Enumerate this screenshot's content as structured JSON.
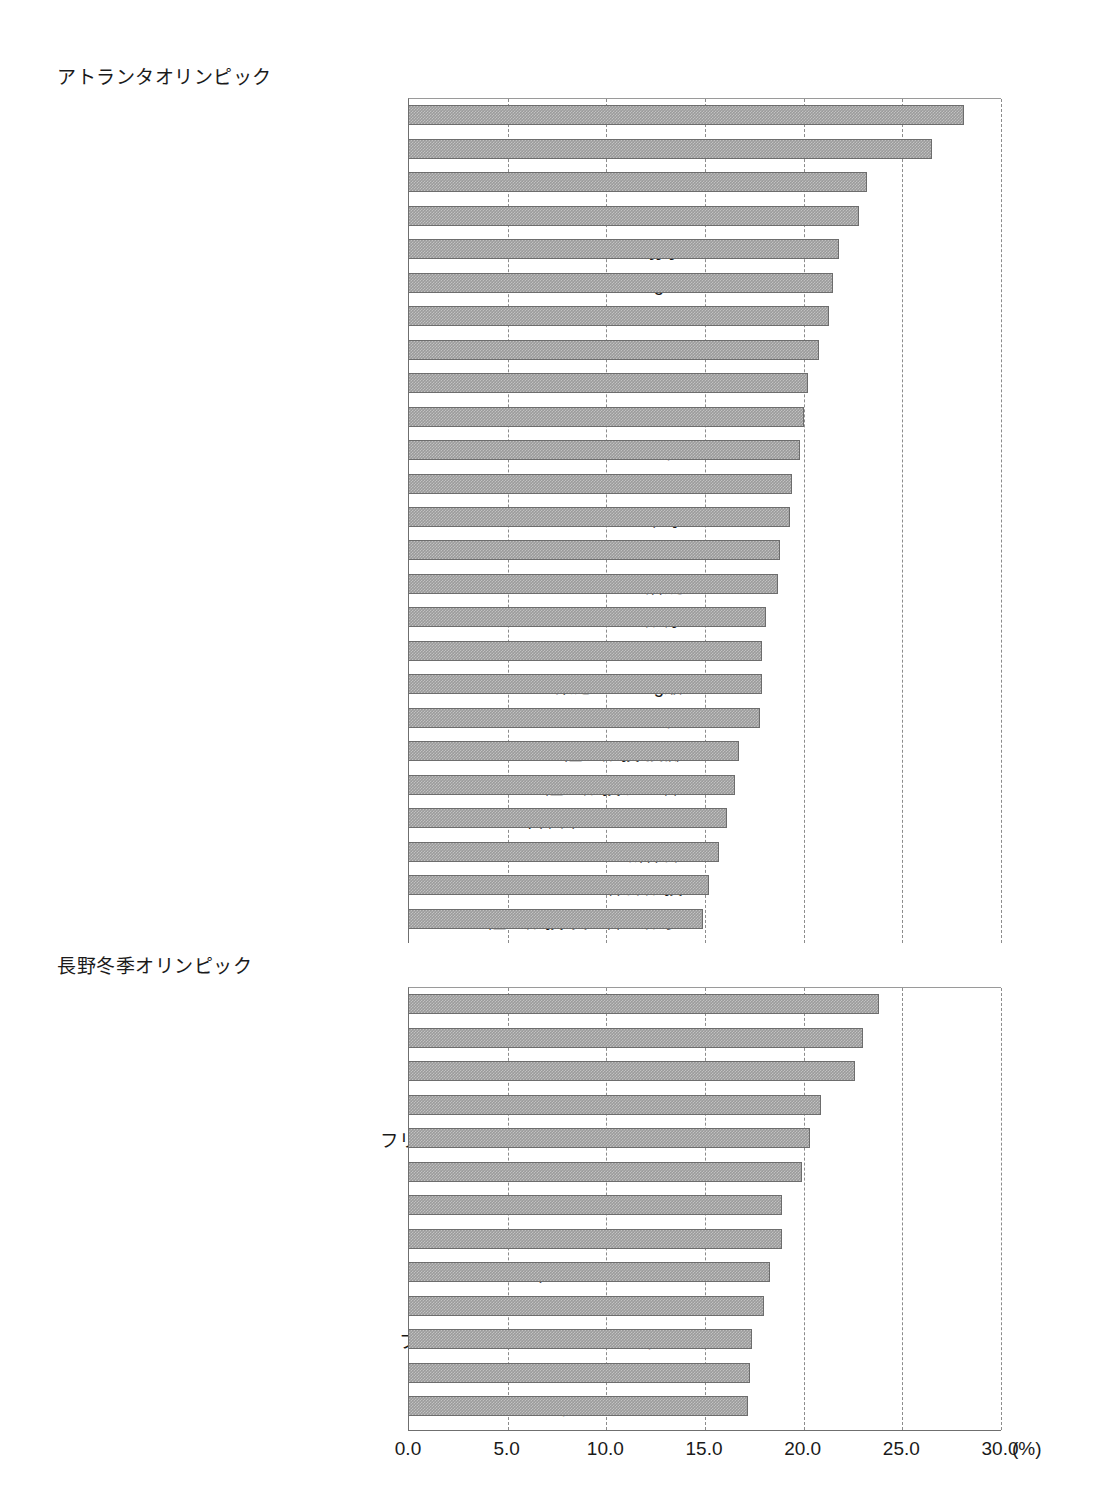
{
  "chart_data": {
    "type": "bar",
    "orientation": "horizontal",
    "title": "",
    "xlabel": "(%)",
    "ylabel": "",
    "xlim": [
      0.0,
      30.0
    ],
    "xticks": [
      "0.0",
      "5.0",
      "10.0",
      "15.0",
      "20.0",
      "25.0",
      "30.0"
    ],
    "xtick_values": [
      0,
      5,
      10,
      15,
      20,
      25,
      30
    ],
    "grid": "vertical dashed gridlines at every 5.0 unit",
    "legend": "none",
    "unit_suffix": "(%)",
    "bar_color": "#9b9b9b",
    "bar_edge_color": "#6d6d6d",
    "groups": [
      {
        "name": "atlanta",
        "title": "アトランタオリンピック",
        "categories": [
          "アーチェリー",
          "ヨット",
          "ソフトボール",
          "ライフル射撃",
          "クレー射撃",
          "柔道61−72kg級",
          "カヌー",
          "自転車 ロード",
          "バスケットボール",
          "サッカー",
          "シンクロナイズドスイミング",
          "バレーボール",
          "卓球",
          "バドミントン",
          "漕艇",
          "競泳",
          "ビーチバレー",
          "柔道48−56kg級",
          "フェンシング",
          "陸上競技 投擲",
          "陸上競技 短距離",
          "自転車 スプリント",
          "新体操",
          "体操競技",
          "陸上競技 長距離・競歩"
        ],
        "values": [
          28.1,
          26.5,
          23.2,
          22.8,
          21.8,
          21.5,
          21.3,
          20.8,
          20.2,
          20.0,
          19.8,
          19.4,
          19.3,
          18.8,
          18.7,
          18.1,
          17.9,
          17.9,
          17.8,
          16.7,
          16.5,
          16.1,
          15.7,
          15.2,
          14.9
        ]
      },
      {
        "name": "nagano",
        "title": "長野冬季オリンピック",
        "categories": [
          "スノーボード・アルペン",
          "アルペンスキー",
          "リュージュ",
          "カーリング",
          "フリースタイルスキー・エアリアル",
          "スノーボード・ハーフパイプ",
          "バイアスロン",
          "スピードスケート短距離",
          "フィギュアスケート",
          "スピードスケート長距離",
          "フリースタイルスキー・モーグル",
          "クロスカントリースキー",
          "ショートトラック"
        ],
        "values": [
          23.8,
          23.0,
          22.6,
          20.9,
          20.3,
          19.9,
          18.9,
          18.9,
          18.3,
          18.0,
          17.4,
          17.3,
          17.2
        ]
      }
    ]
  }
}
